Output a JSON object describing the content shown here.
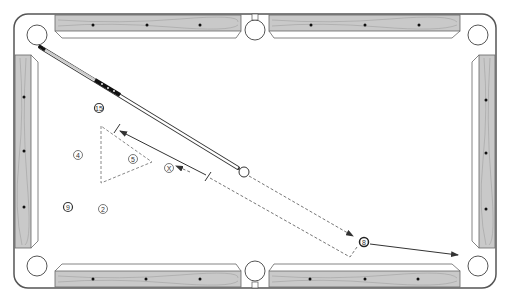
{
  "diagram": {
    "type": "billiards-table",
    "colors": {
      "rail_wood": "#c9c9c9",
      "rail_outline": "#555555",
      "cloth": "#ffffff",
      "line": "#333333",
      "diamond": "#111111"
    },
    "pockets": [
      {
        "name": "top-left",
        "x": 37,
        "y": 35
      },
      {
        "name": "top-middle",
        "x": 255,
        "y": 30
      },
      {
        "name": "top-right",
        "x": 478,
        "y": 35
      },
      {
        "name": "bottom-left",
        "x": 37,
        "y": 266
      },
      {
        "name": "bottom-middle",
        "x": 255,
        "y": 271
      },
      {
        "name": "bottom-right",
        "x": 478,
        "y": 266
      }
    ],
    "diamonds": {
      "top": [
        93,
        147,
        200,
        311,
        365,
        419
      ],
      "bottom": [
        93,
        146,
        200,
        310,
        365,
        418
      ],
      "left": [
        97,
        151,
        207
      ],
      "right": [
        100,
        153,
        209
      ]
    },
    "balls": [
      {
        "id": "ball-15",
        "label": "15",
        "x": 99,
        "y": 108,
        "striped": true
      },
      {
        "id": "ball-4",
        "label": "4",
        "x": 78,
        "y": 155,
        "striped": false
      },
      {
        "id": "ball-5",
        "label": "5",
        "x": 133,
        "y": 159,
        "striped": false
      },
      {
        "id": "ball-x",
        "label": "X",
        "x": 169,
        "y": 168,
        "striped": false
      },
      {
        "id": "ball-9",
        "label": "9",
        "x": 68,
        "y": 207,
        "striped": true
      },
      {
        "id": "ball-2",
        "label": "2",
        "x": 103,
        "y": 209,
        "striped": false
      },
      {
        "id": "ball-8",
        "label": "8",
        "x": 364,
        "y": 242,
        "striped": true
      },
      {
        "id": "cue-ball",
        "label": "",
        "x": 244,
        "y": 172,
        "striped": false
      }
    ],
    "cue_stick": {
      "tip_x": 238,
      "tip_y": 168,
      "butt_x": 37,
      "butt_y": 48
    },
    "rack_triangle": {
      "points": "101,126 101,183 152,162"
    },
    "cue_ball_path": {
      "points": "249,176 355,237"
    },
    "ghost_path": {
      "points": "210,178 350,257 357,247"
    },
    "distance_marker": {
      "x1": 118,
      "y1": 130,
      "x2": 208,
      "y2": 176
    },
    "object_ball_path": {
      "x1": 370,
      "y1": 244,
      "x2": 460,
      "y2": 255
    }
  }
}
